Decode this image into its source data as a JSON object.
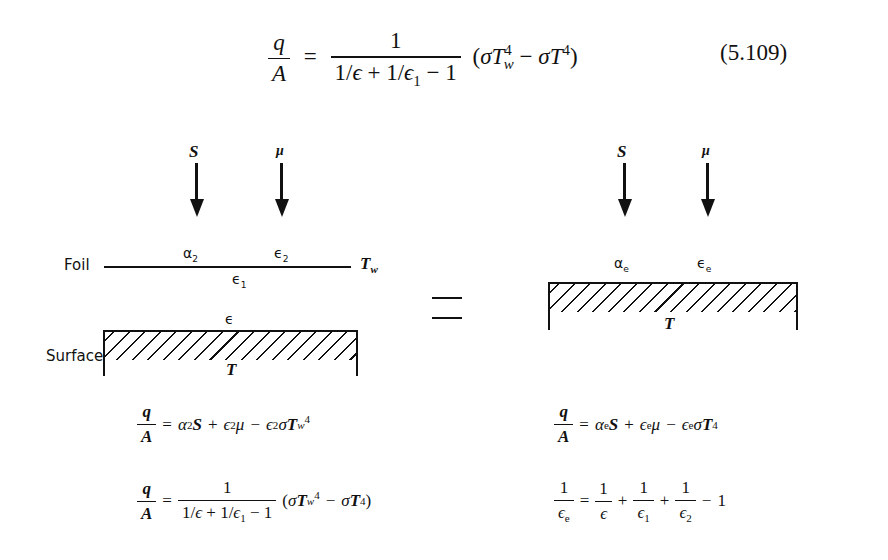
{
  "main_equation": {
    "lhs_num": "q",
    "lhs_den": "A",
    "equals": "=",
    "rhs_num": "1",
    "rhs_den": "1/ϵ + 1/ϵ₁ − 1",
    "rhs_tail": "(σT⁴_w − σT⁴)",
    "number": "(5.109)"
  },
  "left_diagram": {
    "arrow_labels": [
      "S",
      "μ"
    ],
    "foil_label": "Foil",
    "foil_top_labels": [
      "α₂",
      "ϵ₂"
    ],
    "foil_bottom_label": "ϵ₁",
    "foil_temp": "T_w",
    "surface_label": "Surface",
    "surface_top_label": "ϵ",
    "surface_temp": "T"
  },
  "equivalence_symbol": "=",
  "right_diagram": {
    "arrow_labels": [
      "S",
      "μ"
    ],
    "surface_top_labels": [
      "αₑ",
      "ϵₑ"
    ],
    "surface_temp": "T"
  },
  "left_equations": [
    {
      "lhs": "q/A",
      "rhs": "= α₂S + ϵ₂μ − ϵ₂σT_w⁴"
    },
    {
      "lhs": "q/A",
      "rhs": "= 1/(1/ϵ + 1/ϵ₁ − 1) (σT_w⁴ − σT⁴)"
    }
  ],
  "right_equations": [
    {
      "lhs": "q/A",
      "rhs": "= αₑS + ϵₑμ − ϵₑσT⁴"
    },
    {
      "lhs": "1/ϵₑ",
      "rhs": "= 1/ϵ + 1/ϵ₁ + 1/ϵ₂ − 1"
    }
  ],
  "t": {
    "q": "q",
    "A": "A",
    "one": "1",
    "eq": "=",
    "plus": "+",
    "minus": "−",
    "S": "S",
    "mu": "μ",
    "T": "T",
    "w": "w",
    "four": "4",
    "sigma": "σ",
    "alpha": "α",
    "eps": "ϵ",
    "two": "2",
    "e": "e",
    "sub1": "1",
    "slash": "/",
    "lp": "(",
    "rp": ")"
  }
}
